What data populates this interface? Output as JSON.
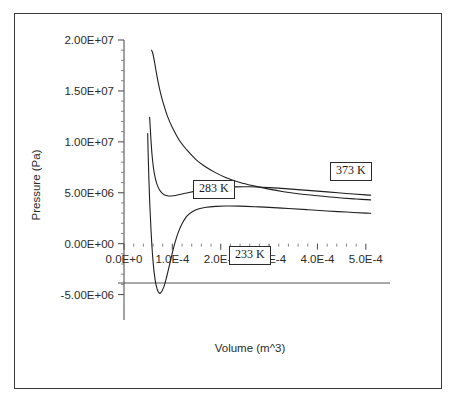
{
  "figure": {
    "background_color": "#ffffff",
    "frame_color": "#3a3a3a",
    "line_color": "#1f1f1f"
  },
  "axis_titles": {
    "x": "Volume (m^3)",
    "y": "Pressure (Pa)"
  },
  "callouts": {
    "hot": "373 K",
    "mid": "283 K",
    "cold": "233 K"
  },
  "chart_data": {
    "type": "line",
    "title": "",
    "subtitle": "",
    "xlabel": "Volume (m^3)",
    "ylabel": "Pressure (Pa)",
    "xlim": [
      0.0,
      0.00055
    ],
    "ylim": [
      -7500000,
      20000000
    ],
    "grid": false,
    "legend_position": "inline-boxed-callouts",
    "annotations": [
      {
        "text": "373 K",
        "x": 0.00042,
        "y": 8300000
      },
      {
        "text": "283 K",
        "x": 0.000205,
        "y": 7200000
      },
      {
        "text": "233 K",
        "x": 0.000255,
        "y": 2300000
      }
    ],
    "x_ticks": [
      {
        "value": 0.0,
        "label": "0.0E+0"
      },
      {
        "value": 0.0001,
        "label": "1.0E-4"
      },
      {
        "value": 0.0002,
        "label": "2.0E-4"
      },
      {
        "value": 0.0003,
        "label": "3.0E-4"
      },
      {
        "value": 0.0004,
        "label": "4.0E-4"
      },
      {
        "value": 0.0005,
        "label": "5.0E-4"
      }
    ],
    "y_ticks": [
      {
        "value": 20000000,
        "label": "2.00E+07"
      },
      {
        "value": 15000000,
        "label": "1.50E+07"
      },
      {
        "value": 10000000,
        "label": "1.00E+07"
      },
      {
        "value": 5000000,
        "label": "5.00E+06"
      },
      {
        "value": 0,
        "label": "0.00E+00"
      },
      {
        "value": -5000000,
        "label": "-5.00E+06"
      }
    ],
    "x_minor_ticks_per_interval": 5,
    "y_minor_ticks_per_interval": 5,
    "series": [
      {
        "name": "373 K",
        "temperature_K": 373,
        "x": [
          5.7e-05,
          6e-05,
          6.4e-05,
          6.8e-05,
          7.4e-05,
          8e-05,
          9e-05,
          0.0001,
          0.000115,
          0.00013,
          0.00015,
          0.00017,
          0.00019,
          0.00021,
          0.00024,
          0.00027,
          0.0003,
          0.00033,
          0.00036,
          0.00039,
          0.00042,
          0.00045,
          0.00048,
          0.00051
        ],
        "y": [
          19000000,
          18600000,
          17600000,
          16500000,
          15100000,
          14000000,
          12500000,
          11400000,
          10100000,
          9200000,
          8200000,
          7500000,
          6950000,
          6500000,
          6000000,
          5650000,
          5350000,
          5100000,
          4900000,
          4750000,
          4600000,
          4480000,
          4380000,
          4300000
        ]
      },
      {
        "name": "283 K",
        "temperature_K": 283,
        "x": [
          5.3e-05,
          5.45e-05,
          5.6e-05,
          5.8e-05,
          6.1e-05,
          6.5e-05,
          7e-05,
          7.6e-05,
          8.3e-05,
          9.2e-05,
          0.000102,
          0.000115,
          0.00013,
          0.00015,
          0.000175,
          0.0002,
          0.00023,
          0.00026,
          0.0003,
          0.00034,
          0.00038,
          0.00042,
          0.00046,
          0.0005,
          0.00051
        ],
        "y": [
          12400000,
          11200000,
          10000000,
          8700000,
          7400000,
          6350000,
          5600000,
          5100000,
          4800000,
          4680000,
          4700000,
          4820000,
          4980000,
          5180000,
          5380000,
          5500000,
          5570000,
          5580000,
          5500000,
          5380000,
          5230000,
          5080000,
          4930000,
          4790000,
          4760000
        ]
      },
      {
        "name": "233 K",
        "temperature_K": 233,
        "x": [
          4.9e-05,
          5e-05,
          5.15e-05,
          5.35e-05,
          5.6e-05,
          5.9e-05,
          6.25e-05,
          6.65e-05,
          7.1e-05,
          7.6e-05,
          8.2e-05,
          8.8e-05,
          9.4e-05,
          0.0001,
          0.000106,
          0.000113,
          0.00012,
          0.00013,
          0.000142,
          0.000155,
          0.00017,
          0.00019,
          0.00021,
          0.00024,
          0.00027,
          0.0003,
          0.00034,
          0.00038,
          0.00042,
          0.00046,
          0.0005,
          0.00051
        ],
        "y": [
          10800000,
          8700000,
          6300000,
          3700000,
          1200000,
          -1100000,
          -2900000,
          -4100000,
          -4750000,
          -4820000,
          -4300000,
          -3300000,
          -2100000,
          -900000,
          200000,
          1200000,
          1950000,
          2700000,
          3150000,
          3420000,
          3580000,
          3660000,
          3690000,
          3680000,
          3630000,
          3560000,
          3450000,
          3330000,
          3210000,
          3100000,
          3000000,
          2980000
        ]
      }
    ]
  }
}
